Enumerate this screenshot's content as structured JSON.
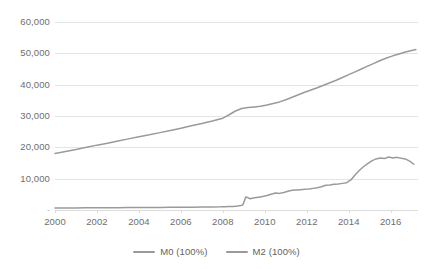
{
  "chart_data": {
    "type": "line",
    "title": "",
    "subtitle": "",
    "xlabel": "",
    "ylabel": "",
    "xlim": [
      2000,
      2017.3
    ],
    "ylim": [
      0,
      60000
    ],
    "grid": true,
    "legend_position": "bottom",
    "y_ticks": [
      {
        "value": 0,
        "label": "-"
      },
      {
        "value": 10000,
        "label": "10,000"
      },
      {
        "value": 20000,
        "label": "20,000"
      },
      {
        "value": 30000,
        "label": "30,000"
      },
      {
        "value": 40000,
        "label": "40,000"
      },
      {
        "value": 50000,
        "label": "50,000"
      },
      {
        "value": 60000,
        "label": "60,000"
      }
    ],
    "x_ticks": [
      {
        "value": 2000,
        "label": "2000"
      },
      {
        "value": 2002,
        "label": "2002"
      },
      {
        "value": 2004,
        "label": "2004"
      },
      {
        "value": 2006,
        "label": "2006"
      },
      {
        "value": 2008,
        "label": "2008"
      },
      {
        "value": 2010,
        "label": "2010"
      },
      {
        "value": 2012,
        "label": "2012"
      },
      {
        "value": 2014,
        "label": "2014"
      },
      {
        "value": 2016,
        "label": "2016"
      }
    ],
    "line_color": "#9a9a9a",
    "grid_color": "#e4e4e4",
    "series": [
      {
        "name": "M0 (100%)",
        "color": "#9a9a9a",
        "x": [
          2000.0,
          2000.5,
          2001.0,
          2001.5,
          2002.0,
          2002.5,
          2003.0,
          2003.5,
          2004.0,
          2004.5,
          2005.0,
          2005.5,
          2006.0,
          2006.5,
          2007.0,
          2007.5,
          2007.9,
          2008.1,
          2008.3,
          2008.5,
          2008.7,
          2008.85,
          2008.95,
          2009.1,
          2009.3,
          2009.5,
          2009.7,
          2009.9,
          2010.1,
          2010.3,
          2010.5,
          2010.7,
          2010.9,
          2011.1,
          2011.3,
          2011.5,
          2011.7,
          2011.9,
          2012.1,
          2012.3,
          2012.5,
          2012.7,
          2012.9,
          2013.1,
          2013.3,
          2013.5,
          2013.7,
          2013.9,
          2014.1,
          2014.3,
          2014.5,
          2014.7,
          2014.9,
          2015.1,
          2015.3,
          2015.5,
          2015.7,
          2015.9,
          2016.1,
          2016.3,
          2016.5,
          2016.7,
          2016.9,
          2017.1
        ],
        "values": [
          620,
          640,
          660,
          690,
          700,
          720,
          740,
          760,
          790,
          810,
          830,
          850,
          880,
          900,
          930,
          960,
          1000,
          1050,
          1100,
          1150,
          1250,
          1400,
          1600,
          4200,
          3600,
          3900,
          4100,
          4300,
          4600,
          5000,
          5400,
          5300,
          5600,
          6000,
          6300,
          6400,
          6500,
          6600,
          6700,
          6900,
          7100,
          7400,
          7900,
          8000,
          8200,
          8300,
          8500,
          8700,
          9600,
          11200,
          12600,
          13800,
          14800,
          15700,
          16300,
          16600,
          16400,
          16900,
          16600,
          16800,
          16500,
          16300,
          15600,
          14600
        ]
      },
      {
        "name": "M2 (100%)",
        "color": "#9a9a9a",
        "x": [
          2000.0,
          2000.5,
          2001.0,
          2001.5,
          2002.0,
          2002.5,
          2003.0,
          2003.5,
          2004.0,
          2004.5,
          2005.0,
          2005.5,
          2006.0,
          2006.5,
          2007.0,
          2007.5,
          2008.0,
          2008.3,
          2008.6,
          2008.9,
          2009.2,
          2009.5,
          2009.8,
          2010.1,
          2010.4,
          2010.7,
          2011.0,
          2011.3,
          2011.6,
          2011.9,
          2012.2,
          2012.5,
          2012.8,
          2013.1,
          2013.4,
          2013.7,
          2014.0,
          2014.3,
          2014.6,
          2014.9,
          2015.2,
          2015.5,
          2015.8,
          2016.1,
          2016.4,
          2016.7,
          2017.0,
          2017.2
        ],
        "values": [
          18000,
          18700,
          19300,
          20000,
          20700,
          21300,
          22000,
          22700,
          23400,
          24000,
          24700,
          25400,
          26100,
          26900,
          27600,
          28400,
          29300,
          30400,
          31600,
          32400,
          32700,
          32900,
          33100,
          33500,
          34000,
          34500,
          35200,
          36000,
          36800,
          37600,
          38300,
          39000,
          39800,
          40600,
          41400,
          42300,
          43200,
          44100,
          45000,
          45900,
          46800,
          47700,
          48500,
          49200,
          49800,
          50400,
          50900,
          51200
        ]
      }
    ]
  },
  "legend": {
    "items": [
      {
        "label": "M0 (100%)",
        "color": "#9a9a9a"
      },
      {
        "label": "M2 (100%)",
        "color": "#9a9a9a"
      }
    ]
  }
}
